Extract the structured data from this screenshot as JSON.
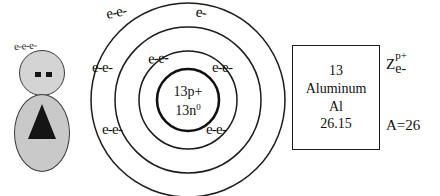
{
  "figure": {
    "electron_label": "e-e-e-",
    "head_name": "figure-head",
    "body_name": "figure-body"
  },
  "atom": {
    "nucleus": {
      "protons": "13p+",
      "neutrons_text": "13n",
      "neutrons_charge": "0"
    },
    "shell_labels": [
      {
        "id": "outer-top-left",
        "text": "e-e-"
      },
      {
        "id": "outer-top-right",
        "text": "e-"
      },
      {
        "id": "middle-top",
        "text": "e-e-"
      },
      {
        "id": "middle-left",
        "text": "e-e-"
      },
      {
        "id": "middle-right",
        "text": "e-e-"
      },
      {
        "id": "outer-bottom-left",
        "text": "e-e-"
      },
      {
        "id": "outer-bottom-right",
        "text": "e-e-"
      }
    ]
  },
  "element_box": {
    "atomic_number": "13",
    "name": "Aluminum",
    "symbol": "Al",
    "atomic_mass": "26.15"
  },
  "annotations": {
    "z_letter": "Z",
    "z_superscript": "p+",
    "z_subscript": "e-",
    "mass_number": "A=26"
  },
  "colors": {
    "ink": "#111111",
    "figure_fill": "#d4d4d4",
    "figure_body_fill": "#c9c9c9",
    "background": "#ffffff"
  }
}
